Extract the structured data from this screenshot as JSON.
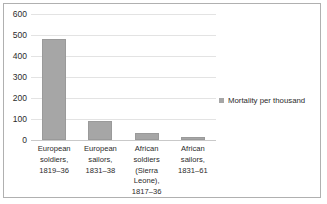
{
  "chart_data": {
    "type": "bar",
    "title": "",
    "xlabel": "",
    "ylabel": "",
    "ylim": [
      0,
      600
    ],
    "yticks": [
      600,
      500,
      400,
      300,
      200,
      100,
      0
    ],
    "grid": true,
    "legend_position": "right",
    "categories": [
      "European soldiers, 1819–36",
      "European sailors, 1831–38",
      "African soldiers (Sierra Leone), 1817–36",
      "African sailors, 1831–61"
    ],
    "category_lines": [
      [
        "European",
        "soldiers,",
        "1819–36"
      ],
      [
        "European",
        "sailors,",
        "1831–38"
      ],
      [
        "African",
        "soldiers",
        "(Sierra",
        "Leone),",
        "1817–36"
      ],
      [
        "African",
        "sailors,",
        "1831–61"
      ]
    ],
    "series": [
      {
        "name": "Mortality per thousand",
        "values": [
          483,
          90,
          35,
          12
        ],
        "color": "#a6a6a6"
      }
    ]
  },
  "legend": {
    "label": "Mortality per thousand",
    "swatch_color": "#a6a6a6"
  },
  "colors": {
    "bar": "#a6a6a6",
    "gridline": "#e3e3e3",
    "axis": "#c9c9c9",
    "border": "#b0b0b0",
    "text": "#2b2b2b"
  }
}
